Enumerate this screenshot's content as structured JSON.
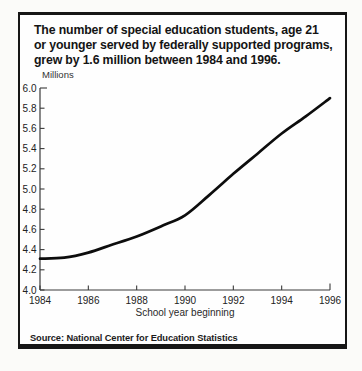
{
  "figure": {
    "headline_lines": [
      "The number of special education students, age 21",
      "or younger served by federally supported programs,",
      "grew by 1.6 million between 1984 and 1996."
    ],
    "source": "Source: National Center for Education Statistics"
  },
  "chart_data": {
    "type": "line",
    "title": "The number of special education students, age 21 or younger served by federally supported programs, grew by 1.6 million between 1984 and 1996.",
    "unit_label": "Millions",
    "xlabel": "School year beginning",
    "ylabel": "Millions",
    "series_name": "Special education students served (millions)",
    "x": [
      1984,
      1985,
      1986,
      1987,
      1988,
      1989,
      1990,
      1991,
      1992,
      1993,
      1994,
      1995,
      1996
    ],
    "values": [
      4.31,
      4.32,
      4.37,
      4.45,
      4.53,
      4.63,
      4.74,
      4.94,
      5.15,
      5.35,
      5.55,
      5.72,
      5.9
    ],
    "xlim": [
      1984,
      1996
    ],
    "ylim": [
      4.0,
      6.0
    ],
    "x_tick_labels": [
      "1984",
      "1986",
      "1988",
      "1990",
      "1992",
      "1994",
      "1996"
    ],
    "y_tick_labels": [
      "6.0",
      "5.8",
      "5.6",
      "5.4",
      "5.2",
      "5.0",
      "4.8",
      "4.6",
      "4.4",
      "4.2",
      "4.0"
    ],
    "grid": false,
    "legend": "none",
    "line_color": "#0d0d0d",
    "axis_color": "#3a3a3a",
    "label_color": "#222222"
  }
}
